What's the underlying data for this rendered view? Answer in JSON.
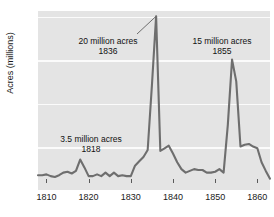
{
  "chart_data": {
    "type": "line",
    "title": "",
    "xlabel": "",
    "ylabel": "Acres (millions)",
    "xlim": [
      1808,
      1863
    ],
    "ylim": [
      0,
      20.6
    ],
    "grid": true,
    "legend": false,
    "x_ticks": [
      1810,
      1820,
      1830,
      1840,
      1850,
      1860
    ],
    "y_ticks": [
      5,
      10,
      15,
      20
    ],
    "series": [
      {
        "name": "Public land sales",
        "x": [
          1808,
          1809,
          1810,
          1811,
          1812,
          1813,
          1814,
          1815,
          1816,
          1817,
          1818,
          1819,
          1820,
          1821,
          1822,
          1823,
          1824,
          1825,
          1826,
          1827,
          1828,
          1829,
          1830,
          1831,
          1832,
          1833,
          1834,
          1835,
          1836,
          1837,
          1838,
          1839,
          1840,
          1841,
          1842,
          1843,
          1844,
          1845,
          1846,
          1847,
          1848,
          1849,
          1850,
          1851,
          1852,
          1853,
          1854,
          1855,
          1856,
          1857,
          1858,
          1859,
          1860,
          1861,
          1862,
          1863
        ],
        "y": [
          1.7,
          1.7,
          1.8,
          1.6,
          1.5,
          1.7,
          2.0,
          2.1,
          1.9,
          2.2,
          3.5,
          2.6,
          1.6,
          1.6,
          1.8,
          1.6,
          2.0,
          1.6,
          2.0,
          1.6,
          1.7,
          1.6,
          1.6,
          2.8,
          3.3,
          3.8,
          4.6,
          12.0,
          20.0,
          4.5,
          4.8,
          5.1,
          4.2,
          3.2,
          2.4,
          2.0,
          2.2,
          2.4,
          2.3,
          2.3,
          2.0,
          2.0,
          2.1,
          2.4,
          2.0,
          7.5,
          15.0,
          12.5,
          5.0,
          5.2,
          5.3,
          5.0,
          4.8,
          3.2,
          2.2,
          1.3
        ]
      }
    ],
    "annotations": [
      {
        "label": "20 million acres",
        "sub": "1836",
        "value": 20,
        "year": 1836
      },
      {
        "label": "15 million acres",
        "sub": "1855",
        "value": 15,
        "year": 1855
      },
      {
        "label": "3.5 million acres",
        "sub": "1818",
        "value": 3.5,
        "year": 1818
      }
    ],
    "colors": {
      "line": "#6e6e6e",
      "plot_background": "#e4e4e4",
      "gridline": "#fbfbfb",
      "text": "#1a1a1a"
    }
  }
}
